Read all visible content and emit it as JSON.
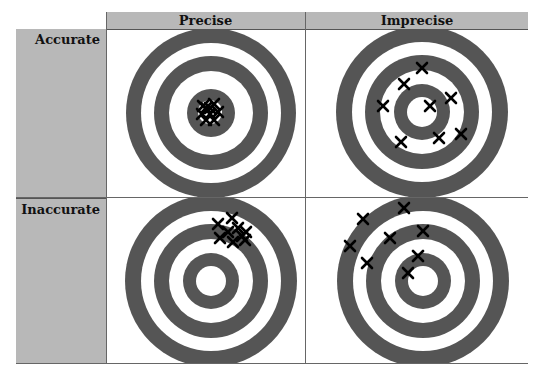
{
  "columns": [
    {
      "label": "Precise"
    },
    {
      "label": "Imprecise"
    }
  ],
  "rows": [
    {
      "label": "Accurate"
    },
    {
      "label": "Inaccurate"
    }
  ],
  "colors": {
    "header_fill": "#b8b8b8",
    "ring_dark": "#555555",
    "ring_light": "#ffffff",
    "marker": "#000000"
  },
  "targets": [
    {
      "name": "accurate-precise",
      "style": "dark-center",
      "marks": [
        [
          206,
          108
        ],
        [
          214,
          104
        ],
        [
          202,
          114
        ],
        [
          210,
          114
        ],
        [
          218,
          112
        ],
        [
          206,
          120
        ],
        [
          214,
          120
        ],
        [
          210,
          108
        ],
        [
          203,
          106
        ]
      ]
    },
    {
      "name": "accurate-imprecise",
      "style": "light-center",
      "marks": [
        [
          422,
          68
        ],
        [
          404,
          84
        ],
        [
          383,
          106
        ],
        [
          430,
          106
        ],
        [
          451,
          98
        ],
        [
          401,
          142
        ],
        [
          439,
          138
        ],
        [
          461,
          134
        ]
      ]
    },
    {
      "name": "inaccurate-precise",
      "style": "light-center",
      "marks": [
        [
          218,
          224
        ],
        [
          232,
          218
        ],
        [
          228,
          232
        ],
        [
          220,
          238
        ],
        [
          238,
          228
        ],
        [
          242,
          236
        ],
        [
          233,
          242
        ],
        [
          246,
          232
        ],
        [
          245,
          240
        ]
      ]
    },
    {
      "name": "inaccurate-imprecise",
      "style": "light-center",
      "marks": [
        [
          404,
          208
        ],
        [
          363,
          219
        ],
        [
          390,
          238
        ],
        [
          423,
          231
        ],
        [
          350,
          246
        ],
        [
          367,
          263
        ],
        [
          418,
          256
        ],
        [
          408,
          273
        ]
      ]
    }
  ]
}
